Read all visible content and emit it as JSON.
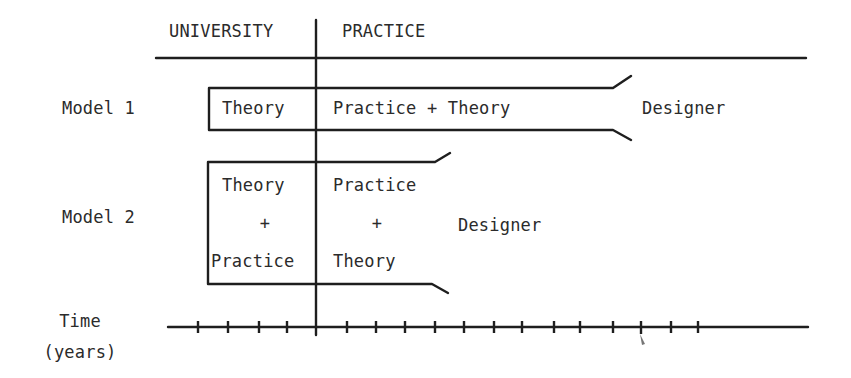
{
  "header": {
    "university": "UNIVERSITY",
    "practice": "PRACTICE"
  },
  "models": [
    {
      "label": "Model 1",
      "university_phase": "Theory",
      "practice_phase": "Practice + Theory",
      "outcome": "Designer"
    },
    {
      "label": "Model 2",
      "university_phase": [
        "Theory",
        "+",
        "Practice"
      ],
      "practice_phase": [
        "Practice",
        "+",
        "Theory"
      ],
      "outcome": "Designer"
    }
  ],
  "axis": {
    "label_line1": "Time",
    "label_line2": "(years)",
    "tick_count_before_divider": 4,
    "tick_count_after_divider": 13
  },
  "colors": {
    "ink": "#1e1e1e",
    "text": "#2b2b2b",
    "background": "#ffffff"
  }
}
